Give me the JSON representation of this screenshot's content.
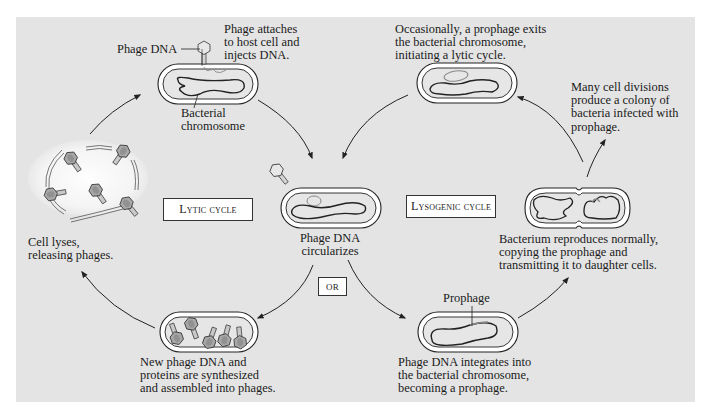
{
  "diagram": {
    "background_color": "#e4e4e4",
    "cycle_labels": {
      "lytic": "Lytic cycle",
      "lysogenic": "Lysogenic cycle",
      "or": "OR"
    },
    "stages": {
      "attach": {
        "caption": [
          "Phage attaches",
          "to host cell and",
          "injects DNA."
        ],
        "callout_phage_dna": "Phage DNA",
        "callout_chromosome": [
          "Bacterial",
          "chromosome"
        ]
      },
      "circularize": {
        "caption": [
          "Phage DNA",
          "circularizes"
        ]
      },
      "synthesize": {
        "caption": [
          "New phage DNA and",
          "proteins are synthesized",
          "and assembled into phages."
        ]
      },
      "lyse": {
        "caption": [
          "Cell lyses,",
          "releasing phages."
        ]
      },
      "integrate": {
        "caption": [
          "Phage DNA integrates into",
          "the bacterial chromosome,",
          "becoming a prophage."
        ],
        "callout_prophage": "Prophage"
      },
      "reproduce": {
        "caption": [
          "Bacterium reproduces normally,",
          "copying the prophage and",
          "transmitting it to daughter cells."
        ]
      },
      "colony": {
        "caption": [
          "Many cell divisions",
          "produce a colony of",
          "bacteria infected with",
          "prophage."
        ]
      },
      "exit": {
        "caption": [
          "Occasionally, a prophage exits",
          "the bacterial chromosome,",
          "initiating a lytic cycle."
        ]
      }
    },
    "arrows": [
      {
        "from": "lyse",
        "to": "attach"
      },
      {
        "from": "attach",
        "to": "circularize"
      },
      {
        "from": "circularize",
        "to": "synthesize"
      },
      {
        "from": "synthesize",
        "to": "lyse"
      },
      {
        "from": "circularize",
        "to": "integrate"
      },
      {
        "from": "integrate",
        "to": "reproduce"
      },
      {
        "from": "reproduce",
        "to": "colony"
      },
      {
        "from": "reproduce",
        "to": "exit"
      },
      {
        "from": "exit",
        "to": "circularize"
      }
    ]
  }
}
